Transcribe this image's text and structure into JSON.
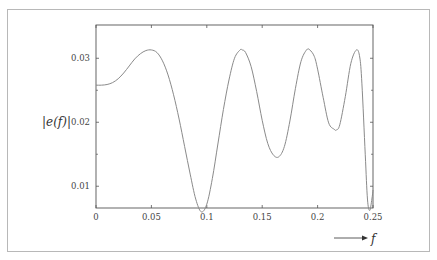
{
  "chart_data": {
    "type": "line",
    "title": "",
    "xlabel": "f",
    "ylabel": "|e(f)|",
    "xlim": [
      0,
      0.25
    ],
    "ylim": [
      0.0066,
      0.0352
    ],
    "grid": false,
    "legend": null,
    "x_ticks": [
      "0",
      "0.05",
      "0.1",
      "0.15",
      "0.2",
      "0.25"
    ],
    "y_ticks": [
      "0.01",
      "0.02",
      "0.03"
    ],
    "series": [
      {
        "name": "|e(f)|",
        "x": [
          0,
          0.005,
          0.01,
          0.015,
          0.02,
          0.025,
          0.03,
          0.035,
          0.04,
          0.045,
          0.05,
          0.055,
          0.06,
          0.065,
          0.07,
          0.075,
          0.08,
          0.085,
          0.09,
          0.095,
          0.1,
          0.105,
          0.11,
          0.115,
          0.12,
          0.125,
          0.13,
          0.132,
          0.135,
          0.14,
          0.145,
          0.15,
          0.155,
          0.16,
          0.165,
          0.17,
          0.175,
          0.18,
          0.185,
          0.19,
          0.193,
          0.197,
          0.2,
          0.205,
          0.21,
          0.215,
          0.217,
          0.22,
          0.225,
          0.23,
          0.235,
          0.238,
          0.24,
          0.243,
          0.245,
          0.247,
          0.249,
          0.25
        ],
        "values": [
          0.0258,
          0.0258,
          0.0259,
          0.0262,
          0.0268,
          0.0277,
          0.0288,
          0.0299,
          0.0307,
          0.0312,
          0.0313,
          0.0309,
          0.0296,
          0.0274,
          0.0243,
          0.0205,
          0.0162,
          0.0119,
          0.008,
          0.006,
          0.0072,
          0.0112,
          0.0166,
          0.022,
          0.0266,
          0.03,
          0.0313,
          0.0313,
          0.0309,
          0.0287,
          0.0248,
          0.0203,
          0.0167,
          0.0149,
          0.0146,
          0.0162,
          0.0202,
          0.0253,
          0.0295,
          0.0313,
          0.0313,
          0.0303,
          0.0283,
          0.0239,
          0.0199,
          0.0189,
          0.0188,
          0.0196,
          0.024,
          0.0292,
          0.0313,
          0.0302,
          0.026,
          0.015,
          0.008,
          0.0062,
          0.008,
          0.0094
        ]
      }
    ]
  },
  "labels": {
    "ylabel": "|e(f)|",
    "xlabel": "f"
  }
}
